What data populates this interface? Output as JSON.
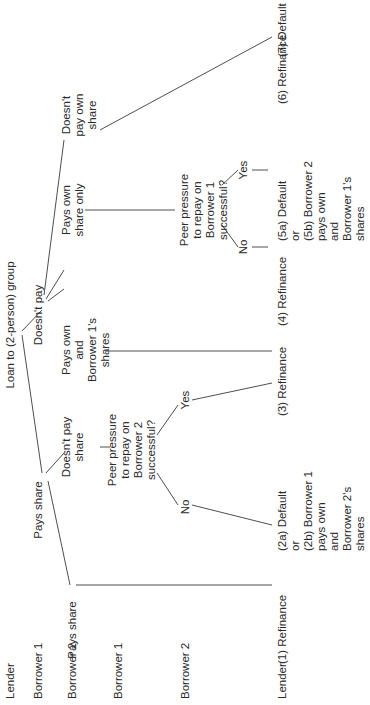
{
  "diagram": {
    "type": "game-tree",
    "orientation": "rotated-90-ccw",
    "row_labels": [
      {
        "label": "Lender",
        "y": 12
      },
      {
        "label": "Borrower 1",
        "y": 40
      },
      {
        "label": "Borrower 2",
        "y": 74
      },
      {
        "label": "Borrower 1",
        "y": 120
      },
      {
        "label": "Borrower 2",
        "y": 187
      },
      {
        "label": "Lender",
        "y": 284
      }
    ],
    "nodes": [
      {
        "id": "root",
        "lines": [
          "Loan to (2-person) group"
        ],
        "x": 380,
        "y": 12
      },
      {
        "id": "b1_pays",
        "lines": [
          "Pays share"
        ],
        "x": 195,
        "y": 40
      },
      {
        "id": "b1_not",
        "lines": [
          "Doesn't pay"
        ],
        "x": 390,
        "y": 40
      },
      {
        "id": "b2_pays_a",
        "lines": [
          "Pays share"
        ],
        "x": 75,
        "y": 74
      },
      {
        "id": "b2_not_a",
        "lines": [
          "Doesn't pay",
          "share"
        ],
        "x": 258,
        "y": 68
      },
      {
        "id": "b2_both",
        "lines": [
          "Pays own",
          "and",
          "Borrower 1's",
          "shares"
        ],
        "x": 355,
        "y": 68
      },
      {
        "id": "b2_own_only",
        "lines": [
          "Pays own",
          "share only"
        ],
        "x": 495,
        "y": 68
      },
      {
        "id": "b2_none",
        "lines": [
          "Doesn't",
          "pay own",
          "share"
        ],
        "x": 590,
        "y": 68
      },
      {
        "id": "peer_b2",
        "lines": [
          "Peer pressure",
          "to repay on",
          "Borrower 2",
          "successful?"
        ],
        "x": 255,
        "y": 114
      },
      {
        "id": "peer_b1",
        "lines": [
          "Peer pressure",
          "to repay on",
          "Borrower 1",
          "successful?"
        ],
        "x": 495,
        "y": 186
      },
      {
        "id": "yes_b2",
        "lines": [
          "Yes"
        ],
        "x": 305,
        "y": 187
      },
      {
        "id": "no_b2",
        "lines": [
          "No"
        ],
        "x": 198,
        "y": 187
      },
      {
        "id": "yes_b1",
        "lines": [
          "Yes"
        ],
        "x": 535,
        "y": 245
      },
      {
        "id": "no_b1",
        "lines": [
          "No"
        ],
        "x": 458,
        "y": 245
      }
    ],
    "outcomes": [
      {
        "id": "o1",
        "lines": [
          "(1) Refinance"
        ],
        "x": 65,
        "y": 284
      },
      {
        "id": "o2",
        "lines": [
          "(2a) Default",
          "or",
          "(2b) Borrower 1",
          "pays own",
          "and",
          "Borrower 2's",
          "shares"
        ],
        "x": 178,
        "y": 284
      },
      {
        "id": "o3",
        "lines": [
          "(3) Refinance"
        ],
        "x": 313,
        "y": 284
      },
      {
        "id": "o4",
        "lines": [
          "(4) Refinance"
        ],
        "x": 403,
        "y": 284
      },
      {
        "id": "o5",
        "lines": [
          "(5a) Default",
          "or",
          "(5b) Borrower 2",
          "pays own",
          "and",
          "Borrower 1's",
          "shares"
        ],
        "x": 488,
        "y": 284
      },
      {
        "id": "o6",
        "lines": [
          "(6) Refinance"
        ],
        "x": 625,
        "y": 284
      },
      {
        "id": "o7",
        "lines": [
          "(7) Default"
        ],
        "x": 672,
        "y": 284
      }
    ],
    "edges": [
      [
        370,
        22,
        232,
        42
      ],
      [
        374,
        22,
        395,
        42
      ],
      [
        232,
        46,
        252,
        64
      ],
      [
        224,
        48,
        120,
        70
      ],
      [
        404,
        48,
        416,
        64
      ],
      [
        406,
        46,
        435,
        64
      ],
      [
        410,
        44,
        565,
        64
      ],
      [
        258,
        100,
        258,
        110
      ],
      [
        120,
        76,
        120,
        272
      ],
      [
        354,
        106,
        354,
        272
      ],
      [
        495,
        85,
        495,
        175
      ],
      [
        232,
        157,
        200,
        178
      ],
      [
        270,
        157,
        300,
        178
      ],
      [
        200,
        192,
        180,
        272
      ],
      [
        305,
        192,
        322,
        272
      ],
      [
        480,
        222,
        458,
        238
      ],
      [
        520,
        222,
        535,
        238
      ],
      [
        458,
        252,
        458,
        268
      ],
      [
        535,
        252,
        535,
        268
      ],
      [
        575,
        100,
        668,
        272
      ]
    ],
    "colors": {
      "text": "#2a2a2a",
      "line": "#3a3a3a",
      "background": "#ffffff"
    }
  }
}
